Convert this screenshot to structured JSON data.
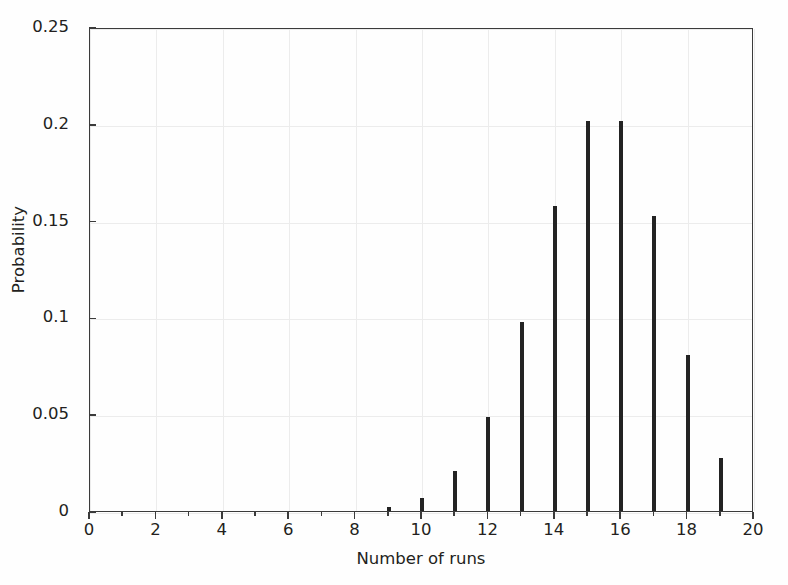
{
  "chart_data": {
    "type": "bar",
    "title": "",
    "subtitle": "",
    "xlabel": "Number of runs",
    "ylabel": "Probability",
    "xlim": [
      0,
      20
    ],
    "ylim": [
      0,
      0.25
    ],
    "grid": true,
    "legend": null,
    "x_tick_labels": [
      "0",
      "2",
      "4",
      "6",
      "8",
      "10",
      "12",
      "14",
      "16",
      "18",
      "20"
    ],
    "x_tick_values": [
      0,
      2,
      4,
      6,
      8,
      10,
      12,
      14,
      16,
      18,
      20
    ],
    "x_minor_tick_values": [
      1,
      3,
      5,
      7,
      9,
      11,
      13,
      15,
      17,
      19
    ],
    "y_tick_labels": [
      "0",
      "0.05",
      "0.1",
      "0.15",
      "0.2",
      "0.25"
    ],
    "y_tick_values": [
      0,
      0.05,
      0.1,
      0.15,
      0.2,
      0.25
    ],
    "bar_color": "#232323",
    "grid_color": "#ececec",
    "axis_color": "#3b3b3b",
    "categories": [
      0,
      1,
      2,
      3,
      4,
      5,
      6,
      7,
      8,
      9,
      10,
      11,
      12,
      13,
      14,
      15,
      16,
      17,
      18,
      19,
      20
    ],
    "values": [
      0,
      0,
      0,
      0,
      0,
      0,
      0,
      0,
      0,
      0.002,
      0.0065,
      0.0205,
      0.0485,
      0.0975,
      0.1575,
      0.2015,
      0.2015,
      0.1525,
      0.0805,
      0.0275,
      0
    ]
  }
}
